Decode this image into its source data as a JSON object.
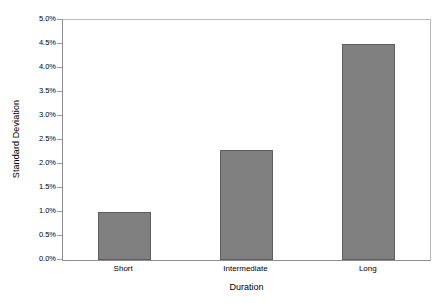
{
  "chart_data": {
    "type": "bar",
    "title": "",
    "subtitle": "",
    "xlabel": "Duration",
    "ylabel": "Standard Deviation",
    "categories": [
      "Short",
      "Intermediate",
      "Long"
    ],
    "values": [
      1.0,
      2.3,
      4.5
    ],
    "value_labels": [
      "1.0%",
      "2.3%",
      "4.5%"
    ],
    "ylim": [
      0.0,
      5.0
    ],
    "ytick_values": [
      0.0,
      0.5,
      1.0,
      1.5,
      2.0,
      2.5,
      3.0,
      3.5,
      4.0,
      4.5,
      5.0
    ],
    "ytick_labels": [
      "0.0%",
      "0.5%",
      "1.0%",
      "1.5%",
      "2.0%",
      "2.5%",
      "3.0%",
      "3.5%",
      "4.0%",
      "4.5%",
      "5.0%"
    ],
    "grid": false,
    "legend": null,
    "legend_position": "none",
    "series": [
      {
        "name": "Standard Deviation",
        "values": [
          1.0,
          2.3,
          4.5
        ]
      }
    ],
    "colors": {
      "bar_fill": "#808080",
      "bar_edge": "#5d5d5d",
      "axis_line": "#8d8d8d",
      "frame_line": "#b9b9b9",
      "background": "#ffffff",
      "text": "#000000"
    }
  }
}
